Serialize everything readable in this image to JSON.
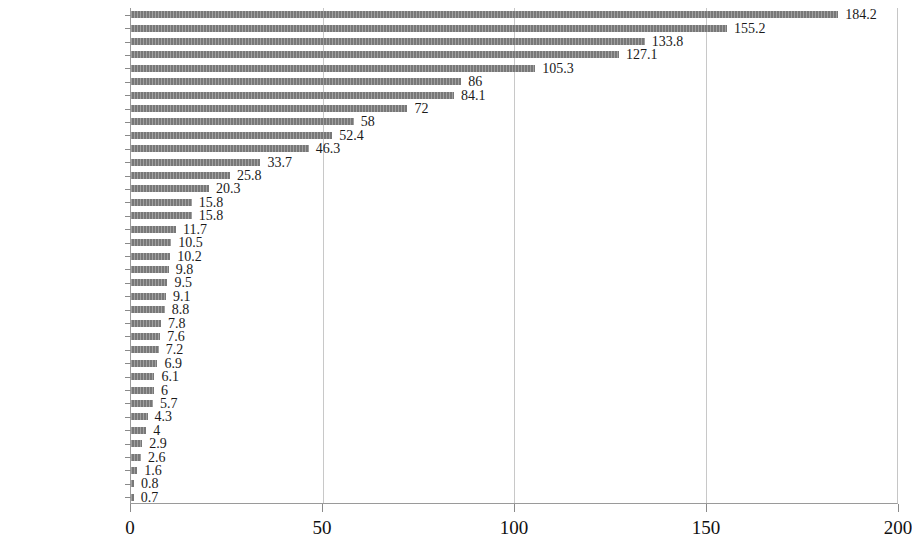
{
  "chart_data": {
    "type": "bar",
    "orientation": "horizontal",
    "title": "",
    "xlabel": "",
    "ylabel": "",
    "xlim": [
      0,
      200
    ],
    "xticks": [
      0,
      50,
      100,
      150,
      200
    ],
    "grid": true,
    "legend": null,
    "bar_color": "#787878",
    "categories": [
      "荷兰",
      "",
      "",
      "澳大利亚",
      "",
      "",
      "美国",
      "",
      "",
      "芬兰",
      "",
      "",
      "新西兰",
      "",
      "",
      "墨西哥",
      "",
      "",
      "葡萄牙",
      "",
      "",
      "波兰",
      "",
      "",
      "意大利",
      "",
      "",
      "俄罗斯",
      "",
      "",
      "匈牙利",
      "",
      "",
      "土耳其",
      "",
      "",
      "法国"
    ],
    "visible_category_labels": [
      "荷兰",
      "澳大利亚",
      "美国",
      "芬兰",
      "新西兰",
      "墨西哥",
      "葡萄牙",
      "波兰",
      "意大利",
      "俄罗斯",
      "匈牙利",
      "土耳其",
      "法国"
    ],
    "values": [
      184.2,
      155.2,
      133.8,
      127.1,
      105.3,
      86,
      84.1,
      72,
      58,
      52.4,
      46.3,
      33.7,
      25.8,
      20.3,
      15.8,
      15.8,
      11.7,
      10.5,
      10.2,
      9.8,
      9.5,
      9.1,
      8.8,
      7.8,
      7.6,
      7.2,
      6.9,
      6.1,
      6,
      5.7,
      4.3,
      4,
      2.9,
      2.6,
      1.6,
      0.8,
      0.7
    ],
    "value_labels": [
      "184.2",
      "155.2",
      "133.8",
      "127.1",
      "105.3",
      "86",
      "84.1",
      "72",
      "58",
      "52.4",
      "46.3",
      "33.7",
      "25.8",
      "20.3",
      "15.8",
      "15.8",
      "11.7",
      "10.5",
      "10.2",
      "9.8",
      "9.5",
      "9.1",
      "8.8",
      "7.8",
      "7.6",
      "7.2",
      "6.9",
      "6.1",
      "6",
      "5.7",
      "4.3",
      "4",
      "2.9",
      "2.6",
      "1.6",
      "0.8",
      "0.7"
    ],
    "xtick_labels": [
      "0",
      "50",
      "100",
      "150",
      "200"
    ]
  }
}
